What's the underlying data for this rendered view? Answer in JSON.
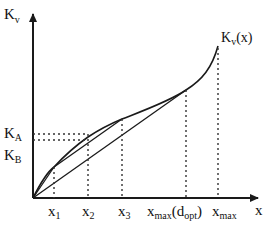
{
  "axes": {
    "y_label_main": "K",
    "y_label_sub": "v",
    "x_label": "x"
  },
  "curve_label": {
    "main": "K",
    "sub": "v",
    "suffix": "(x)"
  },
  "y_ticks": [
    {
      "main": "K",
      "sub": "A"
    },
    {
      "main": "K",
      "sub": "B"
    }
  ],
  "x_ticks": [
    {
      "main": "x",
      "sub": "1",
      "after": ""
    },
    {
      "main": "x",
      "sub": "2",
      "after": ""
    },
    {
      "main": "x",
      "sub": "3",
      "after": ""
    },
    {
      "main": "x",
      "sub": "max",
      "after": "(d",
      "sub2": "opt",
      "tail": ")"
    },
    {
      "main": "x",
      "sub": "max",
      "after": ""
    }
  ],
  "colors": {
    "line": "#1a1a1a",
    "dashed": "#333333"
  }
}
